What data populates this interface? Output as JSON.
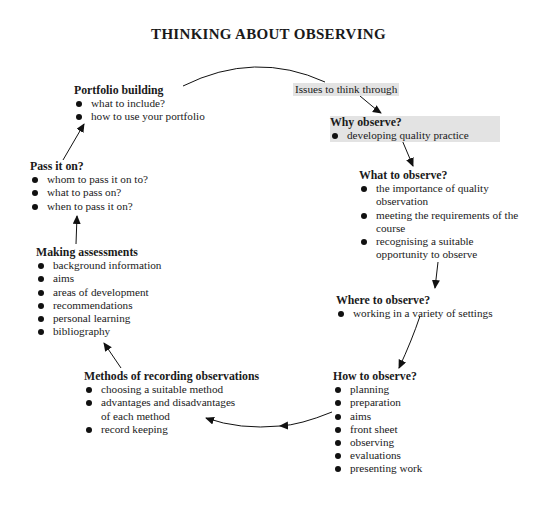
{
  "title": "THINKING ABOUT OBSERVING",
  "start_label": "Issues to think through",
  "nodes": {
    "why": {
      "heading": "Why observe?",
      "items": [
        "developing quality practice"
      ]
    },
    "what": {
      "heading": "What to observe?",
      "items": [
        "the importance of quality observation",
        "meeting the requirements of the course",
        "recognising a suitable opportunity to observe"
      ]
    },
    "where": {
      "heading": "Where to observe?",
      "items": [
        "working in a variety of settings"
      ]
    },
    "how": {
      "heading": "How to observe?",
      "items": [
        "planning",
        "preparation",
        "aims",
        "front sheet",
        "observing",
        "evaluations",
        "presenting work"
      ]
    },
    "methods": {
      "heading": "Methods of recording observations",
      "items": [
        "choosing a suitable method",
        "advantages and disadvantages of each method",
        "record keeping"
      ]
    },
    "assess": {
      "heading": "Making assessments",
      "items": [
        "background information",
        "aims",
        "areas of development",
        "recommendations",
        "personal learning",
        "bibliography"
      ]
    },
    "pass": {
      "heading": "Pass it on?",
      "items": [
        "whom to pass it on to?",
        "what to pass on?",
        "when to pass it on?"
      ]
    },
    "portfolio": {
      "heading": "Portfolio building",
      "items": [
        "what to include?",
        "how to use your portfolio"
      ]
    }
  },
  "colors": {
    "shade": "#e3e3e3",
    "ink": "#1a1a1a"
  }
}
